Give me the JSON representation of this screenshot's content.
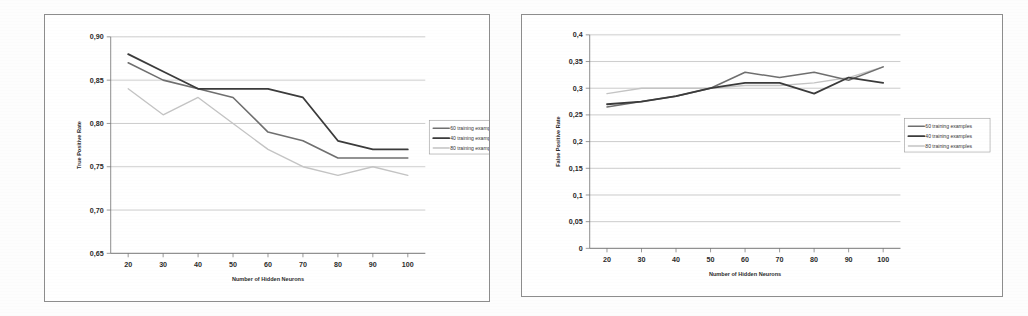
{
  "page": {
    "background_color": "#fdfdfd",
    "figure_count": 2
  },
  "charts": [
    {
      "id": "true-positive-rate-chart",
      "ylabel": "True Positive Rate",
      "xlabel": "Number of Hidden Neurons",
      "ytick_labels": [
        "0,90",
        "0,85",
        "0,80",
        "0,75",
        "0,70",
        "0,65"
      ],
      "xtick_labels": [
        "20",
        "30",
        "40",
        "50",
        "60",
        "70",
        "80",
        "90",
        "100"
      ],
      "legend": [
        {
          "label": "60 training examples",
          "color": "#6f6f6f"
        },
        {
          "label": "40 training examples",
          "color": "#3b3b3b"
        },
        {
          "label": "80 training examples",
          "color": "#c4c4c4"
        }
      ]
    },
    {
      "id": "false-positive-rate-chart",
      "ylabel": "False Positive Rate",
      "xlabel": "Number of Hidden Neurons",
      "ytick_labels": [
        "0,4",
        "0,35",
        "0,3",
        "0,25",
        "0,2",
        "0,15",
        "0,1",
        "0,05",
        "0"
      ],
      "xtick_labels": [
        "20",
        "30",
        "40",
        "50",
        "60",
        "70",
        "80",
        "90",
        "100"
      ],
      "legend": [
        {
          "label": "60 training examples",
          "color": "#6f6f6f"
        },
        {
          "label": "40 training examples",
          "color": "#3b3b3b"
        },
        {
          "label": "80 training examples",
          "color": "#c4c4c4"
        }
      ]
    }
  ],
  "chart_data": [
    {
      "type": "line",
      "title": "",
      "xlabel": "Number of Hidden Neurons",
      "ylabel": "True Positive Rate",
      "x": [
        20,
        30,
        40,
        50,
        60,
        70,
        80,
        90,
        100
      ],
      "xlim": [
        15,
        105
      ],
      "ylim": [
        0.65,
        0.9
      ],
      "yticks": [
        0.65,
        0.7,
        0.75,
        0.8,
        0.85,
        0.9
      ],
      "ytick_labels": [
        "0,65",
        "0,70",
        "0,75",
        "0,80",
        "0,85",
        "0,90"
      ],
      "grid": true,
      "legend_position": "right",
      "series": [
        {
          "name": "60 training examples",
          "color": "#6f6f6f",
          "width": 1.6,
          "values": [
            0.87,
            0.85,
            0.84,
            0.83,
            0.79,
            0.78,
            0.76,
            0.76,
            0.76
          ]
        },
        {
          "name": "40 training examples",
          "color": "#3b3b3b",
          "width": 1.8,
          "values": [
            0.88,
            0.86,
            0.84,
            0.84,
            0.84,
            0.83,
            0.78,
            0.77,
            0.77
          ]
        },
        {
          "name": "80 training examples",
          "color": "#c4c4c4",
          "width": 1.4,
          "values": [
            0.84,
            0.81,
            0.83,
            0.8,
            0.77,
            0.75,
            0.74,
            0.75,
            0.74
          ]
        }
      ]
    },
    {
      "type": "line",
      "title": "",
      "xlabel": "Number of Hidden Neurons",
      "ylabel": "False Positive Rate",
      "x": [
        20,
        30,
        40,
        50,
        60,
        70,
        80,
        90,
        100
      ],
      "xlim": [
        15,
        105
      ],
      "ylim": [
        0,
        0.4
      ],
      "yticks": [
        0,
        0.05,
        0.1,
        0.15,
        0.2,
        0.25,
        0.3,
        0.35,
        0.4
      ],
      "ytick_labels": [
        "0",
        "0,05",
        "0,1",
        "0,15",
        "0,2",
        "0,25",
        "0,3",
        "0,35",
        "0,4"
      ],
      "grid": true,
      "legend_position": "right",
      "series": [
        {
          "name": "60 training examples",
          "color": "#6f6f6f",
          "width": 1.5,
          "values": [
            0.265,
            0.275,
            0.285,
            0.3,
            0.33,
            0.32,
            0.33,
            0.315,
            0.34
          ]
        },
        {
          "name": "40 training examples",
          "color": "#3b3b3b",
          "width": 1.8,
          "values": [
            0.27,
            0.275,
            0.285,
            0.3,
            0.31,
            0.31,
            0.29,
            0.32,
            0.31
          ]
        },
        {
          "name": "80 training examples",
          "color": "#c4c4c4",
          "width": 1.4,
          "values": [
            0.29,
            0.3,
            0.3,
            0.3,
            0.305,
            0.305,
            0.31,
            0.32,
            0.34
          ]
        }
      ]
    }
  ]
}
